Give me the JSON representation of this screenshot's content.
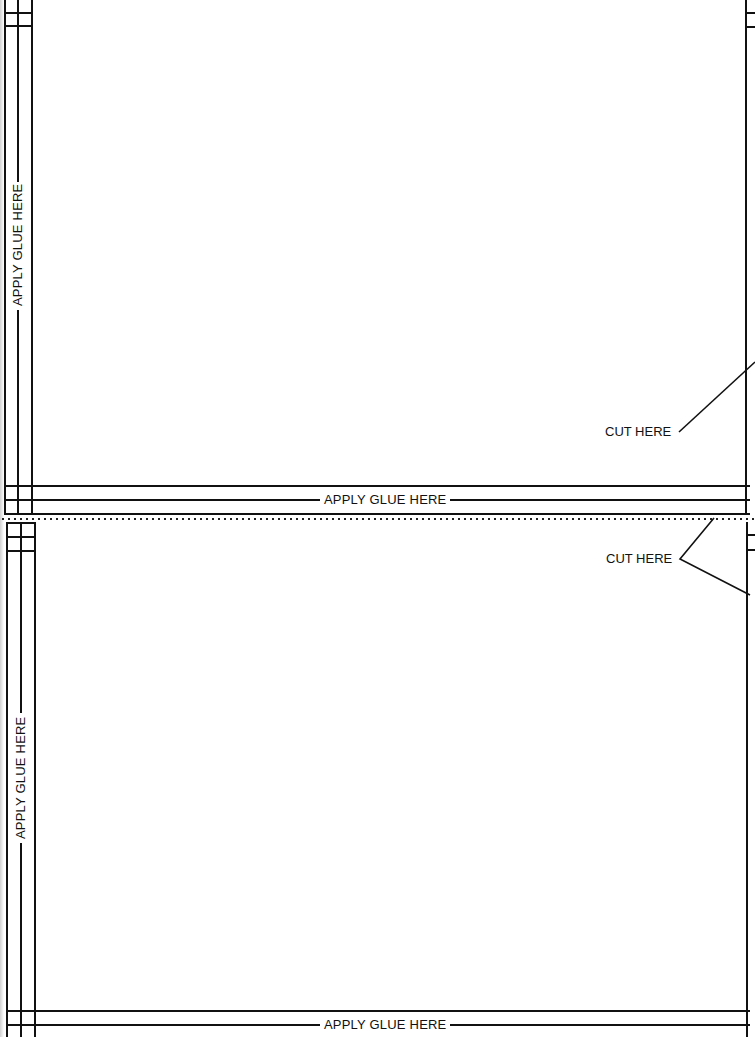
{
  "panels": [
    {
      "id": "top",
      "left_glue_label": "APPLY GLUE HERE",
      "bottom_glue_label": "APPLY GLUE HERE",
      "cut_label": "CUT HERE"
    },
    {
      "id": "bottom",
      "left_glue_label": "APPLY GLUE HERE",
      "bottom_glue_label": "APPLY GLUE HERE",
      "cut_label": "CUT HERE"
    }
  ],
  "separator": {
    "style": "dotted-cut-line"
  },
  "colors": {
    "ink": "#111111",
    "paper": "#ffffff"
  }
}
